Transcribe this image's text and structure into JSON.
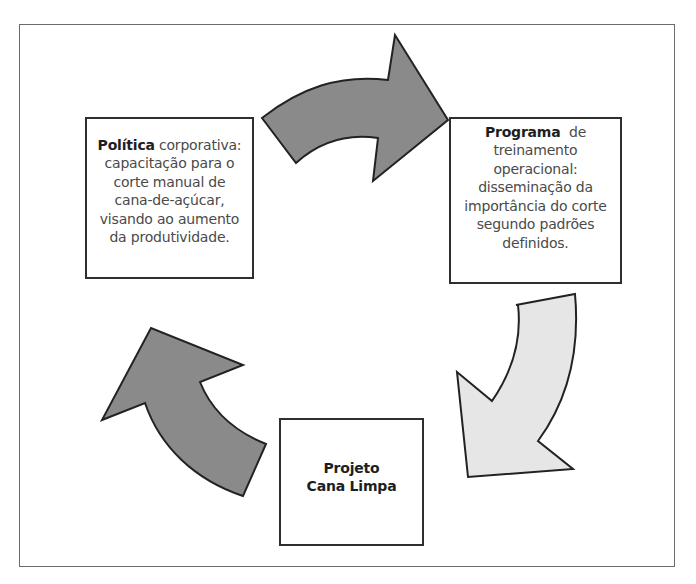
{
  "diagram": {
    "type": "cycle",
    "colors": {
      "frame_border": "#6b6b6b",
      "box_border": "#2e2e2e",
      "dark_arrow_fill": "#8a8a8a",
      "light_arrow_fill": "#e6e6e6",
      "arrow_stroke": "#222222"
    },
    "nodes": [
      {
        "id": "politica",
        "bold": "Política",
        "text": " corporativa: capacitação para o corte manual de cana-de-açúcar, visando ao aumento da produtividade.",
        "lines": [
          "corporativa:",
          "capacitação para o",
          "corte manual de",
          "cana-de-açúcar,",
          "visando ao aumento",
          "da produtividade."
        ]
      },
      {
        "id": "programa",
        "bold": "Programa",
        "text": " de treinamento operacional: disseminação da importância do corte segundo padrões definidos.",
        "lines": [
          "de",
          "treinamento",
          "operacional:",
          "disseminação da",
          "importância do corte",
          "segundo padrões",
          "definidos."
        ]
      },
      {
        "id": "projeto",
        "lines": [
          "Projeto",
          "Cana Limpa"
        ]
      }
    ],
    "edges": [
      {
        "from": "politica",
        "to": "programa",
        "style": "dark",
        "icon": "curved-arrow-right-icon"
      },
      {
        "from": "programa",
        "to": "projeto",
        "style": "light",
        "icon": "curved-arrow-down-left-icon"
      },
      {
        "from": "projeto",
        "to": "politica",
        "style": "dark",
        "icon": "curved-arrow-up-left-icon"
      }
    ]
  }
}
